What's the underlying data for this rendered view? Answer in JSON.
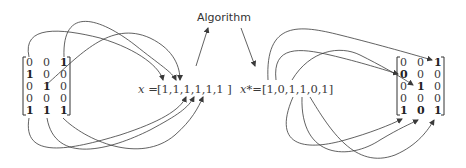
{
  "title": "Algorithm",
  "left_matrix": {
    "rows": [
      [
        "0",
        "0",
        "1"
      ],
      [
        "1",
        "0",
        "0"
      ],
      [
        "0",
        "1",
        "0"
      ],
      [
        "0",
        "0",
        "0"
      ],
      [
        "1",
        "1",
        "1"
      ]
    ]
  },
  "right_matrix": {
    "rows": [
      [
        "0",
        "0",
        "1"
      ],
      [
        "0",
        "0",
        "0"
      ],
      [
        "0",
        "1",
        "0"
      ],
      [
        "0",
        "0",
        "0"
      ],
      [
        "1",
        "0",
        "1"
      ]
    ]
  },
  "x_vector": {
    "label": "x =",
    "value": "[1,1,1,1,1,1 ]"
  },
  "x_star_vector": {
    "label": "x*=",
    "value": "[1,0,1,1,0,1]"
  }
}
